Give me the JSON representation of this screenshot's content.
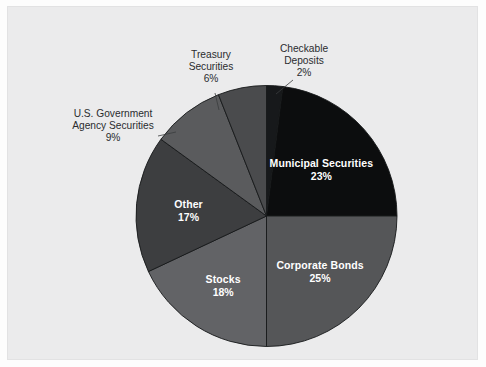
{
  "chart_data": {
    "type": "pie",
    "title": "",
    "subtitle": "",
    "xlabel": "",
    "ylabel": "",
    "legend_position": "none",
    "grid": false,
    "start_angle_deg": 0,
    "direction": "clockwise",
    "categories": [
      "Checkable Deposits",
      "Municipal Securities",
      "Corporate Bonds",
      "Stocks",
      "Other",
      "U.S. Government Agency Securities",
      "Treasury Securities"
    ],
    "values": [
      2,
      23,
      25,
      18,
      17,
      9,
      6
    ],
    "value_labels": [
      "2%",
      "23%",
      "25%",
      "18%",
      "17%",
      "9%",
      "6%"
    ],
    "colors": [
      "#17191b",
      "#0c0d0e",
      "#555658",
      "#626366",
      "#3d3e40",
      "#5a5b5d",
      "#4a4b4d"
    ],
    "slices": [
      {
        "name": "Checkable Deposits",
        "label_line1": "Checkable",
        "label_line2": "Deposits",
        "percent_label": "2%",
        "value": 2,
        "color": "#17191b",
        "label_placement": "outside"
      },
      {
        "name": "Municipal Securities",
        "label_line1": "Municipal Securities",
        "label_line2": "",
        "percent_label": "23%",
        "value": 23,
        "color": "#0c0d0e",
        "label_placement": "inside"
      },
      {
        "name": "Corporate Bonds",
        "label_line1": "Corporate Bonds",
        "label_line2": "",
        "percent_label": "25%",
        "value": 25,
        "color": "#555658",
        "label_placement": "inside"
      },
      {
        "name": "Stocks",
        "label_line1": "Stocks",
        "label_line2": "",
        "percent_label": "18%",
        "value": 18,
        "color": "#626366",
        "label_placement": "inside"
      },
      {
        "name": "Other",
        "label_line1": "Other",
        "label_line2": "",
        "percent_label": "17%",
        "value": 17,
        "color": "#3d3e40",
        "label_placement": "inside"
      },
      {
        "name": "U.S. Government Agency Securities",
        "label_line1": "U.S. Government",
        "label_line2": "Agency Securities",
        "percent_label": "9%",
        "value": 9,
        "color": "#5a5b5d",
        "label_placement": "outside"
      },
      {
        "name": "Treasury Securities",
        "label_line1": "Treasury",
        "label_line2": "Securities",
        "percent_label": "6%",
        "value": 6,
        "color": "#4a4b4d",
        "label_placement": "outside"
      }
    ]
  },
  "panel": {
    "background_color": "#ebebec",
    "border_color": "#e2e2e3"
  }
}
